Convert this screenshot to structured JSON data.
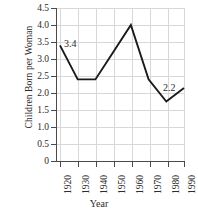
{
  "chart_data": {
    "type": "line",
    "title": "",
    "xlabel": "Year",
    "ylabel": "Children Born per Woman",
    "x": [
      1920,
      1930,
      1940,
      1950,
      1960,
      1970,
      1980,
      1990
    ],
    "values": [
      3.4,
      2.4,
      2.4,
      3.2,
      4.0,
      2.4,
      1.75,
      2.15
    ],
    "series": [
      {
        "name": "Children Born per Woman",
        "values": [
          3.4,
          2.4,
          2.4,
          3.2,
          4.0,
          2.4,
          1.75,
          2.15
        ]
      }
    ],
    "categories": [
      "1920",
      "1930",
      "1940",
      "1950",
      "1960",
      "1970",
      "1980",
      "1990"
    ],
    "xlim": [
      1920,
      1990
    ],
    "ylim": [
      0,
      4.5
    ],
    "yticks": [
      0,
      0.5,
      1.0,
      1.5,
      2.0,
      2.5,
      3.0,
      3.5,
      4.0,
      4.5
    ],
    "ytick_labels": [
      "0",
      "0.5",
      "1.0",
      "1.5",
      "2.0",
      "2.5",
      "3.0",
      "3.5",
      "4.0",
      "4.5"
    ],
    "xticks": [
      1920,
      1930,
      1940,
      1950,
      1960,
      1970,
      1980,
      1990
    ],
    "xtick_labels": [
      "1920",
      "1930",
      "1940",
      "1950",
      "1960",
      "1970",
      "1980",
      "1990"
    ],
    "grid": true,
    "legend": false,
    "legend_position": "none",
    "annotations": [
      {
        "text": "3.4",
        "x": 1920,
        "y": 3.4
      },
      {
        "text": "2.2",
        "x": 1990,
        "y": 2.15
      }
    ],
    "line_color": "#1a1a1a",
    "grid_color": "#d8d8d8",
    "axis_color": "#4a4a4a",
    "background_color": "#ffffff"
  }
}
